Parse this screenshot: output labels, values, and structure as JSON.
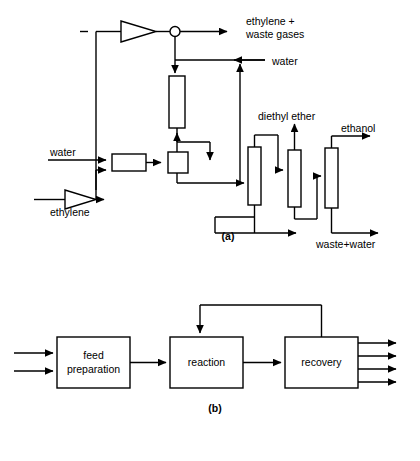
{
  "figure": {
    "captions": {
      "a": "(a)",
      "b": "(b)"
    },
    "colors": {
      "line": "#000000",
      "background": "#ffffff",
      "fill": "#ffffff"
    }
  },
  "panel_a": {
    "caption": "(a)",
    "stream_labels": {
      "water_feed": "water",
      "ethylene_feed": "ethylene",
      "purge": "ethylene +",
      "purge2": "waste gases",
      "water_quench": "water",
      "diethyl_ether": "diethyl ether",
      "ethanol": "ethanol",
      "waste_water": "waste+water"
    },
    "units": [
      {
        "name": "compressor",
        "type": "triangle"
      },
      {
        "name": "mixer-junction",
        "type": "circle"
      },
      {
        "name": "feed-compressor",
        "type": "triangle"
      },
      {
        "name": "heat-exchanger",
        "type": "box"
      },
      {
        "name": "preheater",
        "type": "box"
      },
      {
        "name": "reactor",
        "type": "column"
      },
      {
        "name": "column-1",
        "type": "column"
      },
      {
        "name": "column-2",
        "type": "column"
      },
      {
        "name": "column-3",
        "type": "column"
      }
    ]
  },
  "panel_b": {
    "caption": "(b)",
    "blocks": [
      {
        "id": "feed-preparation",
        "line1": "feed",
        "line2": "preparation"
      },
      {
        "id": "reaction",
        "line1": "reaction",
        "line2": ""
      },
      {
        "id": "recovery",
        "line1": "recovery",
        "line2": ""
      }
    ],
    "feed_arrow_count": 2,
    "product_arrow_count": 4,
    "recycle": "reaction-to-recovery-recycle"
  }
}
